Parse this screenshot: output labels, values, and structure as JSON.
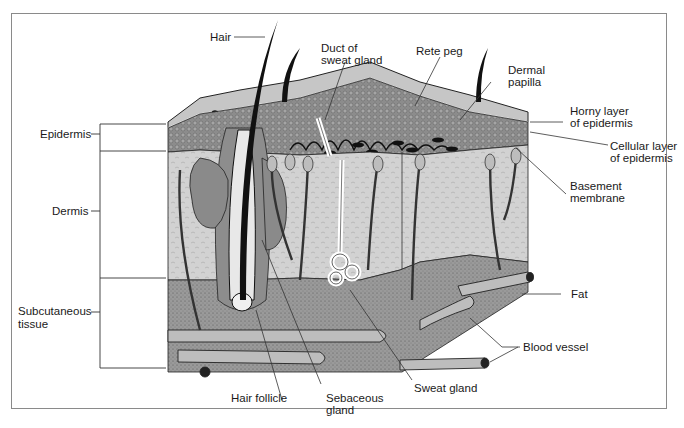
{
  "figure": {
    "frame_color": "#8a8a8a",
    "colors": {
      "surface": "#c9c9c9",
      "epidermis_cellular": "#8f8f8f",
      "dermis": "#cfcfcf",
      "subcutaneous_fat": "#9a9a9a",
      "blood_vessel": "#bdbdbd",
      "hair": "#111111",
      "leader_line": "#333333"
    }
  },
  "labels": {
    "left": {
      "epidermis": "Epidermis",
      "dermis": "Dermis",
      "subcutaneous_1": "Subcutaneous",
      "subcutaneous_2": "tissue"
    },
    "top": {
      "hair": "Hair",
      "duct_1": "Duct of",
      "duct_2": "sweat gland",
      "rete_peg": "Rete peg",
      "dermal_1": "Dermal",
      "dermal_2": "papilla"
    },
    "right": {
      "horny_1": "Horny layer",
      "horny_2": "of epidermis",
      "cellular_1": "Cellular layer",
      "cellular_2": "of epidermis",
      "basement_1": "Basement",
      "basement_2": "membrane",
      "fat": "Fat",
      "blood_vessel": "Blood vessel"
    },
    "bottom": {
      "hair_follicle": "Hair follicle",
      "sebaceous_1": "Sebaceous",
      "sebaceous_2": "gland",
      "sweat_gland": "Sweat gland"
    }
  }
}
